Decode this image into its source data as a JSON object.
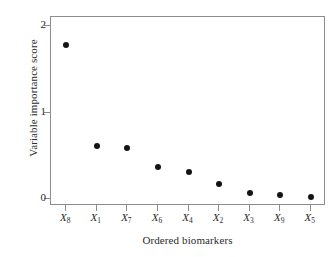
{
  "chart_data": {
    "type": "scatter",
    "title": "",
    "xlabel": "Ordered biomarkers",
    "ylabel": "Variable importance score",
    "categories": [
      "X8",
      "X1",
      "X7",
      "X6",
      "X4",
      "X2",
      "X3",
      "X9",
      "X5"
    ],
    "category_labels": [
      {
        "base": "X",
        "sub": "8"
      },
      {
        "base": "X",
        "sub": "1"
      },
      {
        "base": "X",
        "sub": "7"
      },
      {
        "base": "X",
        "sub": "6"
      },
      {
        "base": "X",
        "sub": "4"
      },
      {
        "base": "X",
        "sub": "2"
      },
      {
        "base": "X",
        "sub": "3"
      },
      {
        "base": "X",
        "sub": "9"
      },
      {
        "base": "X",
        "sub": "5"
      }
    ],
    "values": [
      1.79,
      0.61,
      0.59,
      0.37,
      0.31,
      0.18,
      0.07,
      0.05,
      0.02
    ],
    "ylim": [
      -0.08,
      2.11
    ],
    "yticks": [
      0,
      1,
      2
    ],
    "ytick_labels": [
      "0",
      "1",
      "2"
    ],
    "grid": false,
    "legend": false,
    "marker": "filled-circle",
    "marker_color": "#141414",
    "frame_color": "#8c8c8c",
    "background_color": "#ffffff"
  }
}
